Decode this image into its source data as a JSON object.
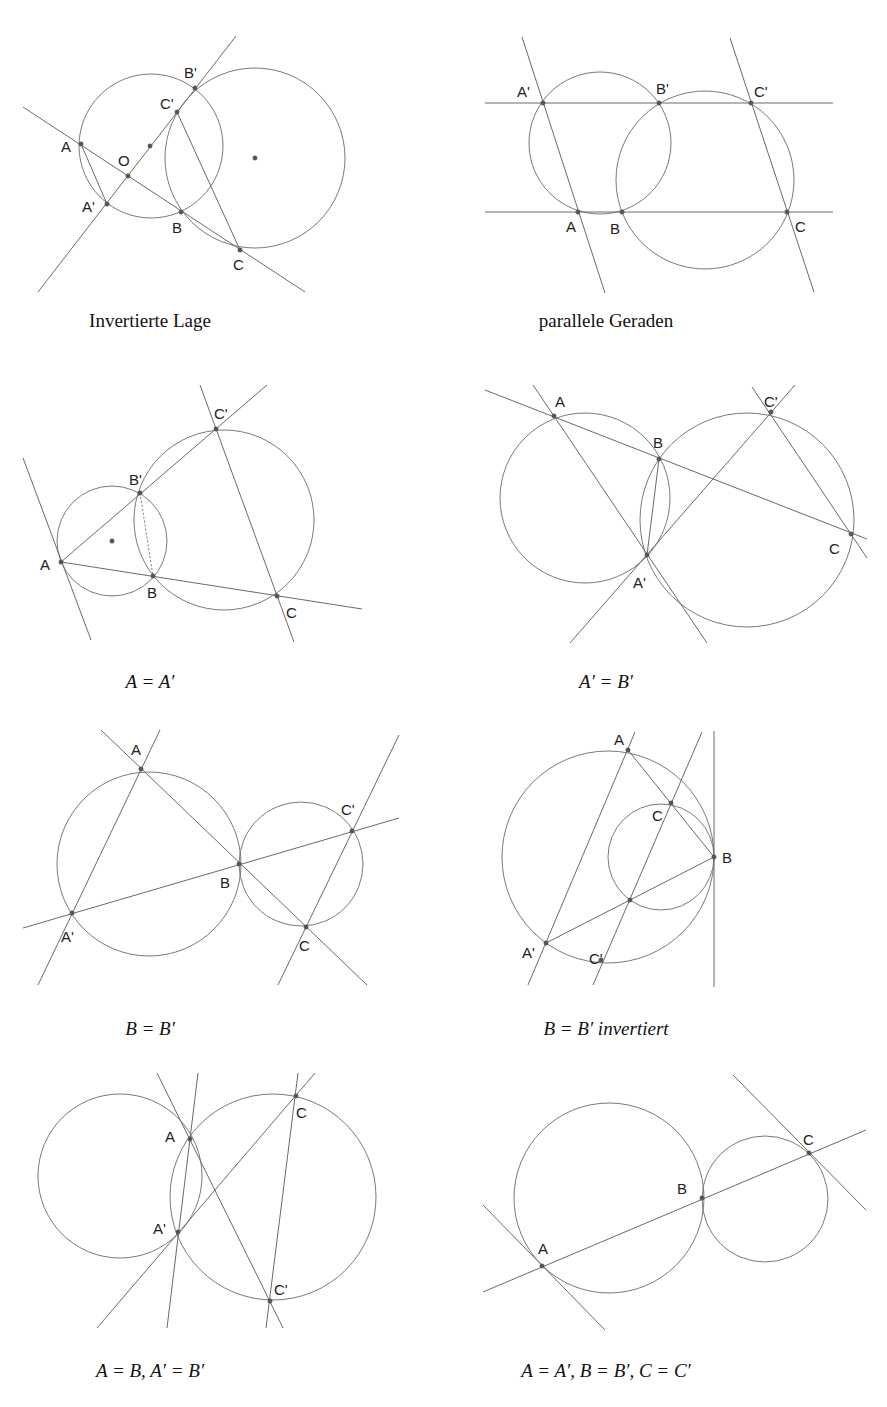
{
  "figures": [
    {
      "id": "invertierte-lage",
      "caption": "Invertierte Lage",
      "caption_pos": [
        150,
        322
      ],
      "circles": [
        {
          "cx": 151,
          "cy": 146,
          "r": 72
        },
        {
          "cx": 255,
          "cy": 158,
          "r": 90
        }
      ],
      "lines": [
        [
          23,
          107,
          305,
          292
        ],
        [
          38,
          292,
          236,
          36
        ],
        [
          81,
          144,
          107,
          204
        ],
        [
          177,
          112,
          240,
          250
        ]
      ],
      "dotted": [],
      "points": [
        {
          "label": "A",
          "x": 81,
          "y": 144,
          "lx": 61,
          "ly": 152
        },
        {
          "label": "O",
          "x": 128,
          "y": 176,
          "lx": 118,
          "ly": 166
        },
        {
          "label": "A'",
          "x": 107,
          "y": 204,
          "lx": 82,
          "ly": 212
        },
        {
          "label": "B",
          "x": 181,
          "y": 212,
          "lx": 172,
          "ly": 233
        },
        {
          "label": "C",
          "x": 240,
          "y": 250,
          "lx": 233,
          "ly": 270
        },
        {
          "label": "C'",
          "x": 177,
          "y": 112,
          "lx": 160,
          "ly": 109
        },
        {
          "label": "B'",
          "x": 195,
          "y": 88,
          "lx": 184,
          "ly": 78
        },
        {
          "label": "",
          "x": 150,
          "y": 146,
          "lx": 0,
          "ly": 0
        },
        {
          "label": "",
          "x": 255,
          "y": 158,
          "lx": 0,
          "ly": 0
        }
      ]
    },
    {
      "id": "parallele-geraden",
      "caption": "parallele Geraden",
      "caption_pos": [
        606,
        322
      ],
      "circles": [
        {
          "cx": 600,
          "cy": 143,
          "r": 71
        },
        {
          "cx": 705,
          "cy": 180,
          "r": 89
        }
      ],
      "lines": [
        [
          485,
          103,
          833,
          103
        ],
        [
          485,
          212,
          833,
          212
        ],
        [
          522,
          37,
          605,
          293
        ],
        [
          730,
          38,
          814,
          292
        ]
      ],
      "dotted": [],
      "points": [
        {
          "label": "A'",
          "x": 543,
          "y": 103,
          "lx": 517,
          "ly": 97
        },
        {
          "label": "B'",
          "x": 659,
          "y": 103,
          "lx": 656,
          "ly": 94
        },
        {
          "label": "C'",
          "x": 751,
          "y": 103,
          "lx": 754,
          "ly": 97
        },
        {
          "label": "A",
          "x": 578,
          "y": 212,
          "lx": 566,
          "ly": 232
        },
        {
          "label": "B",
          "x": 622,
          "y": 212,
          "lx": 610,
          "ly": 234
        },
        {
          "label": "C",
          "x": 787,
          "y": 212,
          "lx": 795,
          "ly": 232
        }
      ]
    },
    {
      "id": "a-gleich-a-strich",
      "caption": "A = A′",
      "caption_pos": [
        150,
        683
      ],
      "circles": [
        {
          "cx": 112,
          "cy": 541,
          "r": 55
        },
        {
          "cx": 224,
          "cy": 520,
          "r": 90
        }
      ],
      "lines": [
        [
          23,
          458,
          91,
          640
        ],
        [
          61,
          562,
          362,
          609
        ],
        [
          61,
          562,
          267,
          385
        ],
        [
          200,
          385,
          294,
          642
        ]
      ],
      "dotted": [
        [
          140,
          493,
          153,
          576
        ]
      ],
      "points": [
        {
          "label": "A",
          "x": 61,
          "y": 562,
          "lx": 40,
          "ly": 570
        },
        {
          "label": "B'",
          "x": 140,
          "y": 493,
          "lx": 129,
          "ly": 485
        },
        {
          "label": "B",
          "x": 153,
          "y": 576,
          "lx": 147,
          "ly": 598
        },
        {
          "label": "C'",
          "x": 216,
          "y": 429,
          "lx": 214,
          "ly": 419
        },
        {
          "label": "C",
          "x": 277,
          "y": 596,
          "lx": 286,
          "ly": 618
        },
        {
          "label": "",
          "x": 112,
          "y": 541,
          "lx": 0,
          "ly": 0
        }
      ]
    },
    {
      "id": "a-strich-gleich-b-strich",
      "caption": "A′ = B′",
      "caption_pos": [
        606,
        683
      ],
      "circles": [
        {
          "cx": 585,
          "cy": 498,
          "r": 85
        },
        {
          "cx": 747,
          "cy": 520,
          "r": 107
        }
      ],
      "lines": [
        [
          485,
          390,
          867,
          539
        ],
        [
          533,
          385,
          707,
          643
        ],
        [
          570,
          643,
          795,
          385
        ],
        [
          752,
          387,
          867,
          558
        ],
        [
          659,
          459,
          647,
          555
        ]
      ],
      "dotted": [],
      "points": [
        {
          "label": "A",
          "x": 554,
          "y": 416,
          "lx": 555,
          "ly": 407
        },
        {
          "label": "B",
          "x": 659,
          "y": 459,
          "lx": 653,
          "ly": 448
        },
        {
          "label": "C'",
          "x": 771,
          "y": 412,
          "lx": 764,
          "ly": 407
        },
        {
          "label": "C",
          "x": 851,
          "y": 534,
          "lx": 829,
          "ly": 554
        },
        {
          "label": "A'",
          "x": 647,
          "y": 555,
          "lx": 633,
          "ly": 588
        }
      ]
    },
    {
      "id": "b-gleich-b-strich",
      "caption": "B = B′",
      "caption_pos": [
        150,
        1030
      ],
      "circles": [
        {
          "cx": 149,
          "cy": 864,
          "r": 92
        },
        {
          "cx": 301,
          "cy": 864,
          "r": 62
        }
      ],
      "lines": [
        [
          23,
          928,
          399,
          818
        ],
        [
          101,
          730,
          367,
          985
        ],
        [
          38,
          985,
          160,
          730
        ],
        [
          278,
          985,
          399,
          735
        ]
      ],
      "dotted": [],
      "points": [
        {
          "label": "A",
          "x": 141,
          "y": 769,
          "lx": 131,
          "ly": 755
        },
        {
          "label": "B",
          "x": 239,
          "y": 864,
          "lx": 220,
          "ly": 888
        },
        {
          "label": "C'",
          "x": 352,
          "y": 831,
          "lx": 341,
          "ly": 815
        },
        {
          "label": "C",
          "x": 306,
          "y": 927,
          "lx": 299,
          "ly": 951
        },
        {
          "label": "A'",
          "x": 72,
          "y": 913,
          "lx": 61,
          "ly": 942
        }
      ]
    },
    {
      "id": "b-gleich-b-strich-invertiert",
      "caption": "B = B′ invertiert",
      "caption_pos": [
        606,
        1030
      ],
      "circles": [
        {
          "cx": 608,
          "cy": 857,
          "r": 106
        },
        {
          "cx": 661,
          "cy": 857,
          "r": 53
        }
      ],
      "lines": [
        [
          714,
          731,
          714,
          987
        ],
        [
          528,
          985,
          635,
          732
        ],
        [
          593,
          985,
          702,
          732
        ],
        [
          628,
          750,
          714,
          857
        ],
        [
          546,
          943,
          714,
          857
        ]
      ],
      "dotted": [],
      "points": [
        {
          "label": "A",
          "x": 628,
          "y": 750,
          "lx": 614,
          "ly": 745
        },
        {
          "label": "C",
          "x": 671,
          "y": 803,
          "lx": 652,
          "ly": 821
        },
        {
          "label": "B",
          "x": 714,
          "y": 857,
          "lx": 722,
          "ly": 863
        },
        {
          "label": "A'",
          "x": 546,
          "y": 943,
          "lx": 522,
          "ly": 958
        },
        {
          "label": "C'",
          "x": 601,
          "y": 960,
          "lx": 589,
          "ly": 964
        },
        {
          "label": "",
          "x": 630,
          "y": 900,
          "lx": 0,
          "ly": 0
        }
      ]
    },
    {
      "id": "a-gleich-b-a-strich-gleich-b-strich",
      "caption": "A = B, A′ = B′",
      "caption_pos": [
        150,
        1372
      ],
      "circles": [
        {
          "cx": 120,
          "cy": 1176,
          "r": 82
        },
        {
          "cx": 273,
          "cy": 1197,
          "r": 103
        }
      ],
      "lines": [
        [
          157,
          1073,
          283,
          1328
        ],
        [
          198,
          1073,
          167,
          1328
        ],
        [
          97,
          1328,
          315,
          1073
        ],
        [
          298,
          1073,
          266,
          1328
        ]
      ],
      "dotted": [],
      "points": [
        {
          "label": "A",
          "x": 190,
          "y": 1139,
          "lx": 165,
          "ly": 1142
        },
        {
          "label": "A'",
          "x": 178,
          "y": 1232,
          "lx": 153,
          "ly": 1234
        },
        {
          "label": "C",
          "x": 296,
          "y": 1096,
          "lx": 296,
          "ly": 1118
        },
        {
          "label": "C'",
          "x": 270,
          "y": 1301,
          "lx": 274,
          "ly": 1295
        }
      ]
    },
    {
      "id": "alle-gleich",
      "caption": "A = A′, B = B′, C = C′",
      "caption_pos": [
        606,
        1372
      ],
      "circles": [
        {
          "cx": 609,
          "cy": 1198,
          "r": 95
        },
        {
          "cx": 765,
          "cy": 1199,
          "r": 63
        }
      ],
      "lines": [
        [
          483,
          1292,
          866,
          1130
        ],
        [
          483,
          1205,
          605,
          1330
        ],
        [
          733,
          1075,
          866,
          1210
        ]
      ],
      "dotted": [],
      "points": [
        {
          "label": "A",
          "x": 542,
          "y": 1266,
          "lx": 538,
          "ly": 1254
        },
        {
          "label": "B",
          "x": 702,
          "y": 1198,
          "lx": 677,
          "ly": 1194
        },
        {
          "label": "C",
          "x": 809,
          "y": 1153,
          "lx": 803,
          "ly": 1145
        }
      ]
    }
  ],
  "colors": {
    "line": "#6a6a6a",
    "circle": "#7a7a7a",
    "point": "#555555",
    "label": "#222222",
    "background": "#ffffff"
  }
}
